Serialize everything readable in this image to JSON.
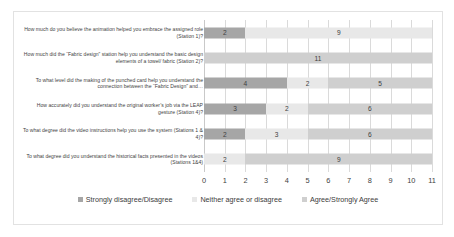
{
  "chart_data": {
    "type": "bar",
    "orientation": "horizontal",
    "stacked": true,
    "title": "",
    "xlabel": "",
    "ylabel": "",
    "xlim": [
      0,
      11
    ],
    "xticks": [
      "0",
      "1",
      "2",
      "3",
      "4",
      "5",
      "6",
      "7",
      "8",
      "9",
      "10",
      "11"
    ],
    "grid": true,
    "legend_position": "bottom",
    "categories": [
      "How much do you believe the animation helped you embrace the assigned role (Station 1)?",
      "How much did the “Fabric design” station help you understand the basic design elements of a towel/ fabric (Station 2)?",
      "To what level did the making of the punched card help you understand the connection between the “Fabric Design” and…",
      "How accurately did you understand the original worker’s job via the LEAP gesture (Station 4)?",
      "To what degree did the video instructions help you use the system (Stations 1 & 4)?",
      "To what degree did you understand the historical facts presented in the videos (Stations 1&4)"
    ],
    "series": [
      {
        "name": "Strongly disagree/Disagree",
        "color": "#a6a6a6",
        "values": [
          2,
          0,
          4,
          3,
          2,
          0
        ]
      },
      {
        "name": "Neither agree or disagree",
        "color": "#e8e8e8",
        "values": [
          9,
          0,
          2,
          2,
          3,
          2
        ]
      },
      {
        "name": "Agree/Strongly Agree",
        "color": "#cfcfcf",
        "values": [
          0,
          11,
          5,
          6,
          6,
          9
        ]
      }
    ],
    "data_labels": [
      [
        {
          "series": "Strongly disagree/Disagree",
          "value": "2"
        },
        {
          "series": "Neither agree or disagree",
          "value": "9"
        }
      ],
      [
        {
          "series": "Agree/Strongly Agree",
          "value": "11"
        }
      ],
      [
        {
          "series": "Strongly disagree/Disagree",
          "value": "4"
        },
        {
          "series": "Neither agree or disagree",
          "value": "2"
        },
        {
          "series": "Agree/Strongly Agree",
          "value": "5"
        }
      ],
      [
        {
          "series": "Strongly disagree/Disagree",
          "value": "3"
        },
        {
          "series": "Neither agree or disagree",
          "value": "2"
        },
        {
          "series": "Agree/Strongly Agree",
          "value": "6"
        }
      ],
      [
        {
          "series": "Strongly disagree/Disagree",
          "value": "2"
        },
        {
          "series": "Neither agree or disagree",
          "value": "3"
        },
        {
          "series": "Agree/Strongly Agree",
          "value": "6"
        }
      ],
      [
        {
          "series": "Neither agree or disagree",
          "value": "2"
        },
        {
          "series": "Agree/Strongly Agree",
          "value": "9"
        }
      ]
    ]
  },
  "legend": {
    "items": [
      {
        "label": "Strongly disagree/Disagree",
        "color": "#a6a6a6"
      },
      {
        "label": "Neither agree or disagree",
        "color": "#e8e8e8"
      },
      {
        "label": "Agree/Strongly Agree",
        "color": "#cfcfcf"
      }
    ]
  }
}
